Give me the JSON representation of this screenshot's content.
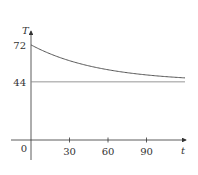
{
  "chart_data": {
    "type": "line",
    "title": "",
    "xlabel": "t",
    "ylabel": "T",
    "origin_label": "0",
    "x_ticks": [
      30,
      60,
      90
    ],
    "x_tick_labels": [
      "30",
      "60",
      "90"
    ],
    "y_ticks": [
      44,
      72
    ],
    "y_tick_labels": [
      "44",
      "72"
    ],
    "xlim": [
      0,
      120
    ],
    "ylim": [
      0,
      72
    ],
    "grid": false,
    "legend": null,
    "series": [
      {
        "name": "T(t) temperature curve",
        "description": "exponential decay from 72 toward 44",
        "x": [
          0,
          15,
          30,
          45,
          60,
          75,
          90,
          105,
          120
        ],
        "values": [
          72,
          65.0,
          60.0,
          56.3,
          53.0,
          50.8,
          49.1,
          48.0,
          47.0
        ]
      },
      {
        "name": "horizontal asymptote",
        "x": [
          0,
          120
        ],
        "values": [
          44,
          44
        ]
      }
    ]
  },
  "colors": {
    "axis": "#333333",
    "curve": "#555555",
    "asymptote": "#8a8a8a",
    "text": "#333333"
  }
}
